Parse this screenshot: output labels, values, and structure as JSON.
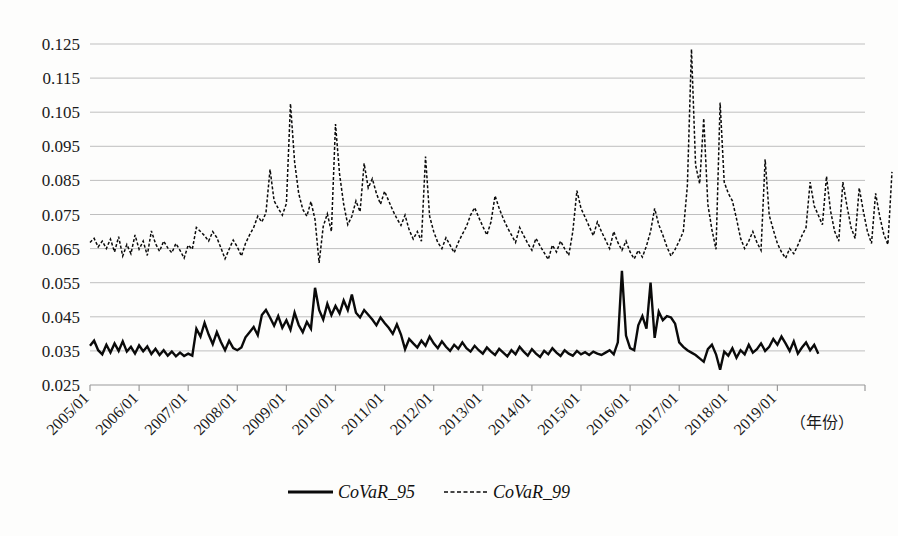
{
  "chart_data": {
    "type": "line",
    "title": "",
    "subtitle": "",
    "xlabel": "（年份）",
    "ylabel": "",
    "grid": true,
    "legend_position": "bottom-center",
    "ylim": [
      0.025,
      0.125
    ],
    "ytick_step": 0.01,
    "ytick_labels": [
      "0.125",
      "0.115",
      "0.105",
      "0.095",
      "0.085",
      "0.075",
      "0.065",
      "0.055",
      "0.045",
      "0.035",
      "0.025"
    ],
    "ytick_values": [
      0.125,
      0.115,
      0.105,
      0.095,
      0.085,
      0.075,
      0.065,
      0.055,
      0.045,
      0.035,
      0.025
    ],
    "xtick_labels": [
      "2005/01",
      "2006/01",
      "2007/01",
      "2008/01",
      "2009/01",
      "2010/01",
      "2011/01",
      "2012/01",
      "2013/01",
      "2014/01",
      "2015/01",
      "2016/01",
      "2017/01",
      "2018/01",
      "2019/01"
    ],
    "x_start": "2005/01",
    "x_end": "2019/08",
    "x_frequency": "monthly",
    "legend": [
      {
        "name": "CoVaR_95",
        "style": "solid",
        "width": "thick",
        "color": "#0a0a0a"
      },
      {
        "name": "CoVaR_99",
        "style": "dashed",
        "width": "thin",
        "color": "#0a0a0a"
      }
    ],
    "series": [
      {
        "name": "CoVaR_95",
        "style": "solid",
        "color": "#0a0a0a",
        "values": [
          0.0365,
          0.038,
          0.0352,
          0.034,
          0.0368,
          0.0345,
          0.0372,
          0.035,
          0.0378,
          0.0348,
          0.0362,
          0.0342,
          0.0366,
          0.0349,
          0.0363,
          0.0341,
          0.0356,
          0.0338,
          0.0352,
          0.0336,
          0.0348,
          0.0334,
          0.0345,
          0.0335,
          0.0342,
          0.0336,
          0.0415,
          0.0392,
          0.0432,
          0.0398,
          0.037,
          0.0405,
          0.0376,
          0.0352,
          0.038,
          0.0358,
          0.0352,
          0.036,
          0.039,
          0.0405,
          0.042,
          0.0396,
          0.0455,
          0.047,
          0.0448,
          0.0424,
          0.0452,
          0.0418,
          0.044,
          0.0412,
          0.0462,
          0.0426,
          0.0405,
          0.0435,
          0.0415,
          0.0535,
          0.047,
          0.0442,
          0.0488,
          0.0455,
          0.0482,
          0.046,
          0.0498,
          0.047,
          0.0515,
          0.0462,
          0.0448,
          0.047,
          0.0456,
          0.0442,
          0.0425,
          0.0448,
          0.0432,
          0.0418,
          0.04,
          0.0428,
          0.0398,
          0.0355,
          0.0385,
          0.0372,
          0.036,
          0.038,
          0.0365,
          0.0392,
          0.0372,
          0.0358,
          0.0378,
          0.0362,
          0.035,
          0.0368,
          0.0356,
          0.0375,
          0.0358,
          0.0348,
          0.0365,
          0.0352,
          0.0342,
          0.036,
          0.0348,
          0.0338,
          0.0356,
          0.0345,
          0.0334,
          0.0352,
          0.034,
          0.0362,
          0.0348,
          0.0336,
          0.0355,
          0.0342,
          0.0332,
          0.035,
          0.034,
          0.0358,
          0.0345,
          0.0335,
          0.0352,
          0.0342,
          0.0336,
          0.035,
          0.034,
          0.0346,
          0.0338,
          0.0348,
          0.0342,
          0.0338,
          0.0345,
          0.0352,
          0.034,
          0.0375,
          0.0585,
          0.0395,
          0.0358,
          0.0352,
          0.0425,
          0.0452,
          0.0415,
          0.055,
          0.0388,
          0.0465,
          0.044,
          0.0452,
          0.0448,
          0.043,
          0.0375,
          0.0362,
          0.0352,
          0.0345,
          0.0338,
          0.0328,
          0.0318,
          0.0355,
          0.0368,
          0.034,
          0.0295,
          0.0348,
          0.0336,
          0.0358,
          0.033,
          0.0352,
          0.034,
          0.0368,
          0.0345,
          0.0355,
          0.0372,
          0.035,
          0.0362,
          0.0385,
          0.0368,
          0.0392,
          0.0372,
          0.035,
          0.0378,
          0.0342,
          0.036,
          0.0375,
          0.0352,
          0.0368,
          0.0342
        ]
      },
      {
        "name": "CoVaR_99",
        "style": "dashed",
        "color": "#0a0a0a",
        "values": [
          0.0668,
          0.068,
          0.0655,
          0.0672,
          0.065,
          0.0678,
          0.064,
          0.0685,
          0.0628,
          0.0662,
          0.0635,
          0.069,
          0.0648,
          0.0672,
          0.063,
          0.0702,
          0.0665,
          0.0642,
          0.0672,
          0.0652,
          0.0638,
          0.0665,
          0.0645,
          0.0622,
          0.066,
          0.0648,
          0.0712,
          0.07,
          0.0688,
          0.0672,
          0.07,
          0.0682,
          0.0652,
          0.062,
          0.0648,
          0.0675,
          0.0655,
          0.0628,
          0.0665,
          0.069,
          0.0712,
          0.0745,
          0.0728,
          0.0755,
          0.0882,
          0.079,
          0.0768,
          0.0748,
          0.0782,
          0.1075,
          0.0905,
          0.0812,
          0.0765,
          0.0745,
          0.0788,
          0.0735,
          0.0608,
          0.0715,
          0.0752,
          0.07,
          0.1015,
          0.0868,
          0.078,
          0.072,
          0.0745,
          0.079,
          0.0758,
          0.09,
          0.0828,
          0.0855,
          0.0812,
          0.078,
          0.0818,
          0.079,
          0.0762,
          0.0738,
          0.0718,
          0.0748,
          0.0705,
          0.0678,
          0.07,
          0.0672,
          0.092,
          0.0745,
          0.07,
          0.0668,
          0.065,
          0.0682,
          0.066,
          0.0638,
          0.0668,
          0.0692,
          0.0715,
          0.0748,
          0.077,
          0.0742,
          0.0715,
          0.069,
          0.0728,
          0.0805,
          0.0768,
          0.0738,
          0.0712,
          0.069,
          0.0668,
          0.0712,
          0.0688,
          0.0665,
          0.0645,
          0.068,
          0.0658,
          0.0638,
          0.0618,
          0.066,
          0.064,
          0.0672,
          0.065,
          0.063,
          0.07,
          0.082,
          0.0768,
          0.0742,
          0.0715,
          0.0688,
          0.0728,
          0.07,
          0.0675,
          0.065,
          0.07,
          0.0668,
          0.0645,
          0.0672,
          0.064,
          0.062,
          0.0645,
          0.0625,
          0.0658,
          0.07,
          0.0768,
          0.072,
          0.069,
          0.0655,
          0.0628,
          0.0648,
          0.0672,
          0.07,
          0.0835,
          0.1235,
          0.0895,
          0.084,
          0.1032,
          0.078,
          0.0705,
          0.0648,
          0.1078,
          0.0845,
          0.0812,
          0.079,
          0.0738,
          0.068,
          0.065,
          0.0672,
          0.07,
          0.0668,
          0.0645,
          0.0912,
          0.0748,
          0.0705,
          0.0665,
          0.064,
          0.0622,
          0.065,
          0.0635,
          0.066,
          0.0688,
          0.0712,
          0.0845,
          0.0775,
          0.0748,
          0.072,
          0.0862,
          0.076,
          0.07,
          0.0672,
          0.0845,
          0.0775,
          0.0712,
          0.068,
          0.0828,
          0.076,
          0.07,
          0.0665,
          0.0812,
          0.0745,
          0.0692,
          0.0662,
          0.0875
        ]
      }
    ]
  },
  "axis_note": "（年份）",
  "legend_text": {
    "series1": "CoVaR_95",
    "series2": "CoVaR_99"
  }
}
